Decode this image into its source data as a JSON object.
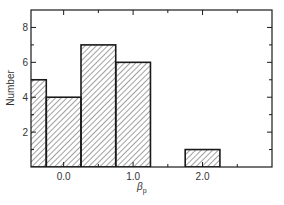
{
  "chart_data": {
    "type": "bar",
    "subtype": "histogram",
    "title": "",
    "xlabel": "β_p",
    "xlabel_main": "β",
    "xlabel_sub": "p",
    "ylabel": "Number",
    "bins": [
      {
        "x0": -0.75,
        "x1": -0.25,
        "count": 5
      },
      {
        "x0": -0.25,
        "x1": 0.25,
        "count": 4
      },
      {
        "x0": 0.25,
        "x1": 0.75,
        "count": 7
      },
      {
        "x0": 0.75,
        "x1": 1.25,
        "count": 6
      },
      {
        "x0": 1.75,
        "x1": 2.25,
        "count": 1
      }
    ],
    "categories": [
      "-0.5",
      "0.0",
      "0.5",
      "1.0",
      "2.0"
    ],
    "values": [
      5,
      4,
      7,
      6,
      1
    ],
    "xlim": [
      -0.47,
      3.0
    ],
    "ylim": [
      0,
      9
    ],
    "x_major_ticks": [
      0.0,
      1.0,
      2.0
    ],
    "x_minor_ticks": [
      0.5,
      1.5,
      2.5
    ],
    "x_tick_labels": [
      "0.0",
      "1.0",
      "2.0"
    ],
    "y_major_ticks": [
      2,
      4,
      6,
      8
    ],
    "y_minor_ticks": [
      1,
      3,
      5,
      7
    ],
    "y_tick_labels": [
      "2",
      "4",
      "6",
      "8"
    ],
    "fill": "diagonal-hatch",
    "grid": false,
    "legend": null,
    "colors": {
      "line": "#1a1a1a",
      "hatch": "#444444",
      "background": "#ffffff"
    }
  }
}
